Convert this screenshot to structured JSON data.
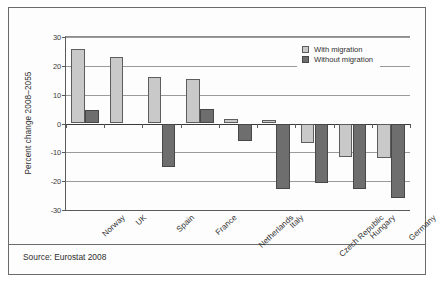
{
  "chart_data": {
    "type": "bar",
    "title": "",
    "xlabel": "",
    "ylabel": "Percent change 2008–2055",
    "ylim": [
      -30,
      30
    ],
    "yticks": [
      30,
      20,
      10,
      0,
      -10,
      -20,
      -30
    ],
    "ytick_labels": [
      "30",
      "20",
      "10",
      "0",
      "-10",
      "-20",
      "-30"
    ],
    "grid": true,
    "legend_position": "top-right",
    "categories": [
      "Norway",
      "UK",
      "Spain",
      "France",
      "Netherlands",
      "Italy",
      "Czech Republic",
      "Hungary",
      "Germany"
    ],
    "series": [
      {
        "name": "With migration",
        "color": "#c9c9c9",
        "values": [
          26,
          23,
          16.2,
          15.3,
          1.6,
          1.1,
          -6.8,
          -11.6,
          -11.9
        ]
      },
      {
        "name": "Without migration",
        "color": "#6e6e6e",
        "values": [
          4.6,
          0,
          -15,
          5.2,
          -6,
          -22.8,
          -20.7,
          -22.8,
          -26
        ]
      }
    ]
  },
  "footer": {
    "source": "Source: Eurostat 2008"
  }
}
